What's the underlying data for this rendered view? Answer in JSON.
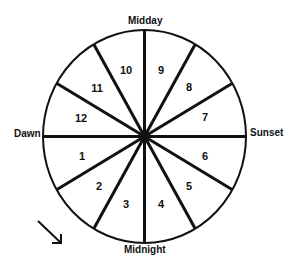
{
  "labels": {
    "top": "Midday",
    "right": "Sunset",
    "bottom": "Midnight",
    "left": "Dawn"
  },
  "segments": [
    "1",
    "2",
    "3",
    "4",
    "5",
    "6",
    "7",
    "8",
    "9",
    "10",
    "11",
    "12"
  ],
  "arrow": "clockwise-direction-arrow",
  "colors": {
    "line": "#111111",
    "background": "#ffffff"
  }
}
